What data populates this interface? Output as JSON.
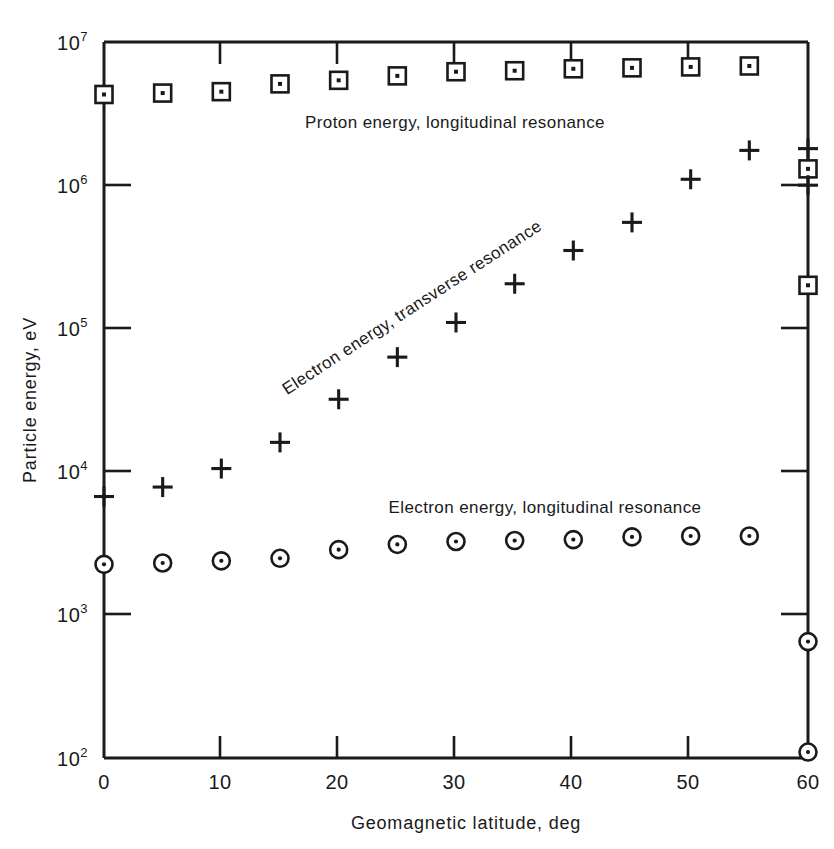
{
  "chart_data": {
    "type": "scatter",
    "title": "",
    "xlabel": "Geomagnetic latitude, deg",
    "ylabel": "Particle energy, eV",
    "xlim": [
      0,
      60
    ],
    "ylim": [
      100,
      10000000
    ],
    "yscale": "log",
    "xscale": "linear",
    "grid": false,
    "legend_position": "inline-annotations",
    "xticks": [
      0,
      10,
      20,
      30,
      40,
      50,
      60
    ],
    "xtick_labels": [
      "0",
      "10",
      "20",
      "30",
      "40",
      "50",
      "60"
    ],
    "yticks": [
      100,
      1000,
      10000,
      100000,
      1000000,
      10000000
    ],
    "ytick_labels": [
      "10²",
      "10³",
      "10⁴",
      "10⁵",
      "10⁶",
      "10⁷"
    ],
    "ytick_mantissas": [
      "10",
      "10",
      "10",
      "10",
      "10",
      "10"
    ],
    "ytick_exponents": [
      "2",
      "3",
      "4",
      "5",
      "6",
      "7"
    ],
    "series": [
      {
        "name": "Proton energy, longitudinal resonance",
        "marker": "square-dot",
        "annotation": "Proton energy, longitudinal resonance",
        "x": [
          0,
          5,
          10,
          15,
          20,
          25,
          30,
          35,
          40,
          45,
          50,
          55,
          60,
          60
        ],
        "values": [
          4300000,
          4400000,
          4500000,
          5100000,
          5400000,
          5800000,
          6200000,
          6300000,
          6500000,
          6600000,
          6700000,
          6800000,
          1300000,
          200000
        ]
      },
      {
        "name": "Electron energy, transverse resonance",
        "marker": "plus",
        "annotation": "Electron energy, transverse resonance",
        "x": [
          0,
          5,
          10,
          15,
          20,
          25,
          30,
          35,
          40,
          45,
          50,
          55,
          60,
          60
        ],
        "values": [
          6700,
          7800,
          10500,
          16000,
          32000,
          63000,
          110000,
          205000,
          350000,
          550000,
          1100000,
          1750000,
          1800000,
          1000000
        ]
      },
      {
        "name": "Electron energy, longitudinal resonance",
        "marker": "circle-dot",
        "annotation": "Electron energy, longitudinal resonance",
        "x": [
          0,
          5,
          10,
          15,
          20,
          25,
          30,
          35,
          40,
          45,
          50,
          55,
          60,
          60
        ],
        "values": [
          2250,
          2300,
          2380,
          2480,
          2850,
          3100,
          3250,
          3300,
          3350,
          3500,
          3550,
          3550,
          650,
          110
        ]
      }
    ],
    "annotations": [
      {
        "text": "Proton energy, longitudinal resonance",
        "x": 22.5,
        "y": 3000000,
        "rotation": 0
      },
      {
        "text": "Electron energy, transverse resonance",
        "x": 22.0,
        "y": 60000,
        "rotation": -33
      },
      {
        "text": "Electron energy, longitudinal resonance",
        "x": 35.0,
        "y": 7000,
        "rotation": 0
      }
    ]
  }
}
